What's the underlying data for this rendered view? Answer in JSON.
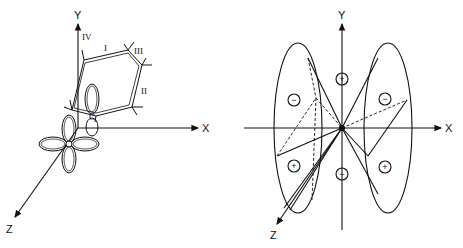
{
  "left_panel": {
    "axes": {
      "x": "X",
      "y": "Y",
      "z": "Z"
    },
    "ring_labels": [
      "I",
      "II",
      "III",
      "IV"
    ],
    "atom_label": "C"
  },
  "right_panel": {
    "axes": {
      "x": "X",
      "y": "Y",
      "z": "Z"
    },
    "signs": {
      "left_upper": "−",
      "left_lower": "+",
      "right_upper": "−",
      "right_lower": "+",
      "axis_upper": "+",
      "axis_lower": "−"
    }
  }
}
